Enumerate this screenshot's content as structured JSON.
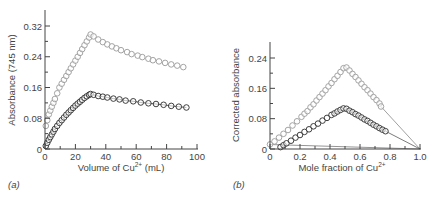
{
  "chart_data": [
    {
      "panel": "(a)",
      "type": "scatter",
      "xlabel": "Volume of Cu²⁺ (mL)",
      "ylabel": "Absorbance (745 nm)",
      "xlim": [
        0,
        100
      ],
      "ylim": [
        0,
        0.35
      ],
      "xticks": [
        "0",
        "20",
        "40",
        "60",
        "80",
        "100"
      ],
      "yticks": [
        "0",
        "0.08",
        "0.16",
        "0.24",
        "0.32"
      ],
      "grid": false,
      "series": [
        {
          "name": "upper (gray)",
          "color": "#9a9a9a",
          "x": [
            0.5,
            1.5,
            2.5,
            3.5,
            4.5,
            5.5,
            6.5,
            8,
            9.5,
            11,
            12.5,
            14,
            15.5,
            17,
            18.5,
            20,
            21.5,
            23,
            24.5,
            26,
            27.5,
            29,
            30,
            32,
            35,
            38,
            41,
            44,
            47,
            50,
            54,
            57,
            61,
            64,
            68,
            71,
            75,
            79,
            83,
            87,
            91
          ],
          "y": [
            0.06,
            0.075,
            0.09,
            0.1,
            0.11,
            0.12,
            0.13,
            0.145,
            0.16,
            0.17,
            0.18,
            0.19,
            0.2,
            0.21,
            0.22,
            0.23,
            0.24,
            0.25,
            0.26,
            0.27,
            0.28,
            0.29,
            0.298,
            0.293,
            0.285,
            0.278,
            0.272,
            0.267,
            0.262,
            0.257,
            0.252,
            0.247,
            0.243,
            0.239,
            0.235,
            0.231,
            0.228,
            0.224,
            0.22,
            0.217,
            0.213
          ]
        },
        {
          "name": "lower (black)",
          "color": "#2a2a2a",
          "x": [
            0.5,
            1.5,
            2.5,
            3.5,
            4.5,
            5.5,
            6.5,
            8,
            9.5,
            11,
            12.5,
            14,
            15.5,
            17,
            18.5,
            20,
            21.5,
            23,
            24.5,
            26,
            27.5,
            29,
            30,
            32,
            35,
            38,
            41,
            45,
            49,
            53,
            58,
            63,
            68,
            73,
            78,
            83,
            88,
            93
          ],
          "y": [
            0.008,
            0.016,
            0.024,
            0.031,
            0.038,
            0.045,
            0.052,
            0.06,
            0.068,
            0.075,
            0.082,
            0.089,
            0.095,
            0.101,
            0.107,
            0.113,
            0.118,
            0.123,
            0.128,
            0.133,
            0.137,
            0.141,
            0.143,
            0.141,
            0.138,
            0.136,
            0.134,
            0.131,
            0.129,
            0.126,
            0.124,
            0.121,
            0.119,
            0.117,
            0.115,
            0.112,
            0.11,
            0.108
          ]
        }
      ]
    },
    {
      "panel": "(b)",
      "type": "scatter",
      "xlabel": "Mole fraction of Cu²⁺",
      "ylabel": "Corrected absorbance",
      "xlim": [
        0,
        1.0
      ],
      "ylim": [
        0,
        0.28
      ],
      "xticks": [
        "0",
        "0.2",
        "0.4",
        "0.6",
        "0.8",
        "1.0"
      ],
      "yticks": [
        "0",
        "0.08",
        "0.16",
        "0.24"
      ],
      "grid": false,
      "series": [
        {
          "name": "upper (gray)",
          "color": "#9a9a9a",
          "x": [
            0.0,
            0.03,
            0.06,
            0.09,
            0.12,
            0.15,
            0.18,
            0.21,
            0.23,
            0.25,
            0.27,
            0.29,
            0.31,
            0.33,
            0.35,
            0.37,
            0.39,
            0.41,
            0.43,
            0.45,
            0.47,
            0.49,
            0.51,
            0.53,
            0.55,
            0.57,
            0.59,
            0.61,
            0.63,
            0.65,
            0.67,
            0.69,
            0.71,
            0.73,
            0.74
          ],
          "y": [
            0.012,
            0.02,
            0.03,
            0.04,
            0.05,
            0.062,
            0.073,
            0.085,
            0.093,
            0.1,
            0.11,
            0.118,
            0.128,
            0.137,
            0.146,
            0.155,
            0.165,
            0.174,
            0.184,
            0.193,
            0.203,
            0.213,
            0.215,
            0.207,
            0.198,
            0.19,
            0.181,
            0.172,
            0.163,
            0.155,
            0.146,
            0.137,
            0.129,
            0.12,
            0.112
          ]
        },
        {
          "name": "lower (black)",
          "color": "#2a2a2a",
          "x": [
            0.07,
            0.09,
            0.11,
            0.14,
            0.17,
            0.2,
            0.23,
            0.26,
            0.29,
            0.32,
            0.35,
            0.38,
            0.41,
            0.43,
            0.45,
            0.47,
            0.49,
            0.51,
            0.53,
            0.55,
            0.57,
            0.59,
            0.61,
            0.63,
            0.65,
            0.67,
            0.69,
            0.71,
            0.73,
            0.75,
            0.77
          ],
          "y": [
            0.005,
            0.01,
            0.015,
            0.022,
            0.03,
            0.037,
            0.045,
            0.052,
            0.06,
            0.067,
            0.075,
            0.082,
            0.09,
            0.094,
            0.099,
            0.103,
            0.107,
            0.106,
            0.101,
            0.097,
            0.092,
            0.088,
            0.083,
            0.078,
            0.074,
            0.069,
            0.064,
            0.06,
            0.055,
            0.051,
            0.047
          ]
        }
      ],
      "annotations": [
        "extrapolated lines from both series converge to (1.0, 0)"
      ]
    }
  ],
  "labels": {
    "a": {
      "panel": "(a)",
      "ylabel_main": "Absorbance (745 nm)",
      "xlabel_prefix": "Volume of Cu",
      "xlabel_sup": "2+",
      "xlabel_suffix": " (mL)"
    },
    "b": {
      "panel": "(b)",
      "ylabel_main": "Corrected absorbance",
      "xlabel_prefix": "Mole fraction of Cu",
      "xlabel_sup": "2+",
      "xlabel_suffix": ""
    }
  }
}
